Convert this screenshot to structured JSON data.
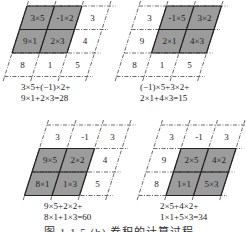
{
  "colors": {
    "fill": "#9c9c9c",
    "line": "#222222",
    "dash": "#444444",
    "text": "#222222"
  },
  "panels": [
    {
      "id": "top-left",
      "origin": [
        27,
        6
      ],
      "cell_w": 27.5,
      "cell_h": 23.5,
      "skew": 7.5,
      "cells": [
        [
          "3×5",
          "-1×2",
          "3"
        ],
        [
          "9×1",
          "2×3",
          "4"
        ],
        [
          "8",
          "1",
          "5"
        ]
      ],
      "shaded": [
        [
          0,
          0
        ],
        [
          0,
          1
        ],
        [
          1,
          0
        ],
        [
          1,
          1
        ]
      ],
      "formula": [
        "3×5+(−1)×2+",
        "9×1+2×3=28"
      ],
      "formula_pos": [
        21,
        82
      ]
    },
    {
      "id": "top-right",
      "origin": [
        139,
        6
      ],
      "cell_w": 27.5,
      "cell_h": 23.5,
      "skew": 7.5,
      "cells": [
        [
          "3",
          "-1×5",
          "3×2"
        ],
        [
          "9",
          "2×1",
          "4×3"
        ],
        [
          "8",
          "1",
          "5"
        ]
      ],
      "shaded": [
        [
          0,
          1
        ],
        [
          0,
          2
        ],
        [
          1,
          1
        ],
        [
          1,
          2
        ]
      ],
      "formula": [
        "(−1)×5+3×2+",
        "2×1+4×3=15"
      ],
      "formula_pos": [
        140,
        82
      ]
    },
    {
      "id": "bottom-left",
      "origin": [
        47,
        125
      ],
      "cell_w": 27.5,
      "cell_h": 23.5,
      "skew": 7.5,
      "cells": [
        [
          "3",
          "-1",
          "3"
        ],
        [
          "9×5",
          "2×2",
          "4"
        ],
        [
          "8×1",
          "1×3",
          "5"
        ]
      ],
      "shaded": [
        [
          1,
          0
        ],
        [
          1,
          1
        ],
        [
          2,
          0
        ],
        [
          2,
          1
        ]
      ],
      "formula": [
        "9×5+2×2+",
        "8×1+1×3=60"
      ],
      "formula_pos": [
        44,
        201
      ]
    },
    {
      "id": "bottom-right",
      "origin": [
        161,
        125
      ],
      "cell_w": 27.5,
      "cell_h": 23.5,
      "skew": 7.5,
      "cells": [
        [
          "3",
          "-1",
          "3"
        ],
        [
          "9",
          "2×5",
          "4×2"
        ],
        [
          "8",
          "1×1",
          "5×3"
        ]
      ],
      "shaded": [
        [
          1,
          1
        ],
        [
          1,
          2
        ],
        [
          2,
          1
        ],
        [
          2,
          2
        ]
      ],
      "formula": [
        "2×5+4×2+",
        "1×1+5×3=34"
      ],
      "formula_pos": [
        160,
        201
      ]
    }
  ],
  "caption": "图 1.1.5    (b) 卷积的计算过程"
}
